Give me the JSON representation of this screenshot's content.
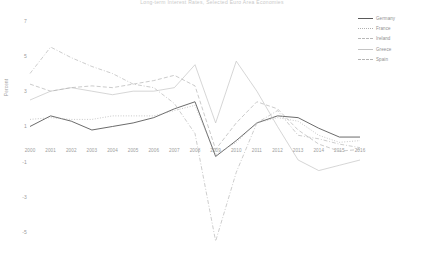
{
  "chart_title": "Long-term Interest Rates, Selected Euro Area Economies",
  "corner_note": "",
  "axis": {
    "ylabel": "Percent",
    "yticks": [
      "7",
      "5",
      "3",
      "1",
      "-1",
      "-3",
      "-5"
    ],
    "ytick_values": [
      7,
      5,
      3,
      1,
      -1,
      -3,
      -5
    ],
    "xticks": [
      "2000",
      "2001",
      "2002",
      "2003",
      "2004",
      "2005",
      "2006",
      "2007",
      "2008",
      "2009",
      "2010",
      "2011",
      "2012",
      "2013",
      "2014",
      "2015",
      "2016"
    ]
  },
  "legend": {
    "items": [
      {
        "label": "Germany",
        "style": "solid",
        "color": "#5a5a5a"
      },
      {
        "label": "France",
        "style": "dotted",
        "color": "#b0b0b0"
      },
      {
        "label": "Ireland",
        "style": "dashdot",
        "color": "#b8b8b8"
      },
      {
        "label": "Greece",
        "style": "solid",
        "color": "#c4c4c4"
      },
      {
        "label": "Spain",
        "style": "dashed",
        "color": "#b4b4b4"
      }
    ]
  },
  "chart_data": {
    "type": "line",
    "title": "Long-term Interest Rates, Selected Euro Area Economies",
    "xlabel": "",
    "ylabel": "Percent",
    "x": [
      2000,
      2001,
      2002,
      2003,
      2004,
      2005,
      2006,
      2007,
      2008,
      2009,
      2010,
      2011,
      2012,
      2013,
      2014,
      2015,
      2016
    ],
    "xlim": [
      2000,
      2016
    ],
    "ylim": [
      -6,
      7.6
    ],
    "grid": false,
    "legend_position": "top-right",
    "series": [
      {
        "name": "Germany",
        "style": "solid",
        "color": "#5a5a5a",
        "values": [
          1.0,
          1.6,
          1.3,
          0.8,
          1.0,
          1.2,
          1.5,
          2.0,
          2.4,
          -0.7,
          0.2,
          1.2,
          1.6,
          1.5,
          0.9,
          0.4,
          0.4
        ]
      },
      {
        "name": "France",
        "style": "dotted",
        "color": "#b0b0b0",
        "values": [
          1.4,
          1.5,
          1.4,
          1.4,
          1.6,
          1.6,
          1.6,
          1.9,
          2.2,
          -0.6,
          0.1,
          1.2,
          1.5,
          1.3,
          0.5,
          0.1,
          0.2
        ]
      },
      {
        "name": "Ireland",
        "style": "dashdot",
        "color": "#b8b8b8",
        "values": [
          4.0,
          5.5,
          4.9,
          4.4,
          4.0,
          3.4,
          3.2,
          2.3,
          0.6,
          -5.5,
          -1.6,
          1.2,
          1.9,
          0.5,
          0.3,
          0.0,
          -0.2
        ]
      },
      {
        "name": "Greece",
        "style": "solid",
        "color": "#c4c4c4",
        "values": [
          2.5,
          3.0,
          3.2,
          3.0,
          2.8,
          3.0,
          3.0,
          3.2,
          4.5,
          1.2,
          4.7,
          3.0,
          1.0,
          -0.9,
          -1.5,
          -1.2,
          -0.9
        ]
      },
      {
        "name": "Spain",
        "style": "dashed",
        "color": "#b4b4b4",
        "values": [
          3.4,
          3.0,
          3.2,
          3.3,
          3.2,
          3.4,
          3.6,
          3.9,
          3.3,
          -0.3,
          1.2,
          2.4,
          2.0,
          0.8,
          0.0,
          -0.4,
          -0.3
        ]
      }
    ]
  }
}
